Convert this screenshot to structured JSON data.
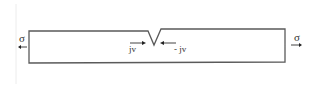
{
  "diagram": {
    "left_stress_label": "σ",
    "right_stress_label": "σ",
    "left_flux_label": "jv",
    "right_flux_label": "- jv",
    "colors": {
      "line": "#5a5a5a",
      "edge": "#e6e6e6"
    }
  }
}
